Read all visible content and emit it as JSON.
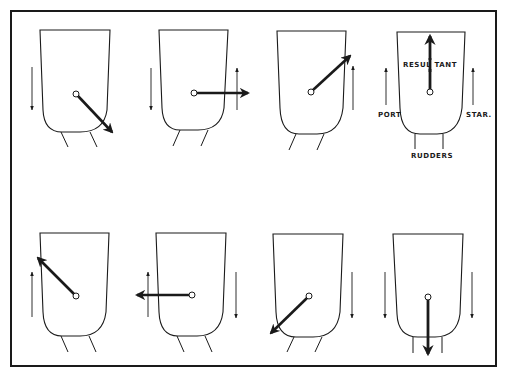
{
  "figure": {
    "frame_color": "#1a1a1a",
    "stroke_color": "#1a1a1a",
    "background": "#ffffff"
  },
  "labels": {
    "resultant": "RESUL TANT",
    "port": "PORT",
    "starboard": "STAR.",
    "rudders": "RUDDERS"
  },
  "panels": [
    {
      "id": 1,
      "row": "top",
      "resultant_direction": "down-right",
      "port_flow": "down",
      "starboard_flow": "none",
      "rudders": "angled"
    },
    {
      "id": 2,
      "row": "top",
      "resultant_direction": "right",
      "port_flow": "down",
      "starboard_flow": "up",
      "rudders": "angled"
    },
    {
      "id": 3,
      "row": "top",
      "resultant_direction": "up-right",
      "port_flow": "none",
      "starboard_flow": "up",
      "rudders": "angled"
    },
    {
      "id": 4,
      "row": "top",
      "resultant_direction": "up",
      "port_flow": "up",
      "starboard_flow": "up",
      "rudders": "straight",
      "labeled": true
    },
    {
      "id": 5,
      "row": "bottom",
      "resultant_direction": "up-left",
      "port_flow": "up",
      "starboard_flow": "none",
      "rudders": "angled"
    },
    {
      "id": 6,
      "row": "bottom",
      "resultant_direction": "left",
      "port_flow": "up",
      "starboard_flow": "down",
      "rudders": "angled"
    },
    {
      "id": 7,
      "row": "bottom",
      "resultant_direction": "down-left",
      "port_flow": "none",
      "starboard_flow": "down",
      "rudders": "angled"
    },
    {
      "id": 8,
      "row": "bottom",
      "resultant_direction": "down",
      "port_flow": "down",
      "starboard_flow": "down",
      "rudders": "straight"
    }
  ]
}
